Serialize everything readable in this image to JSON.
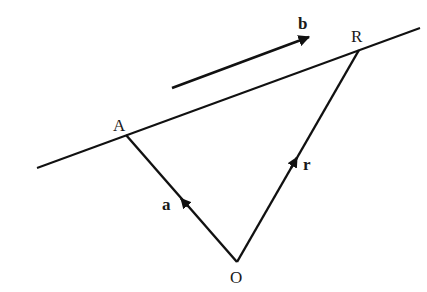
{
  "diagram": {
    "type": "vector-line-diagram",
    "colors": {
      "stroke": "#111111",
      "background": "#ffffff"
    },
    "points": {
      "A": {
        "label": "A",
        "x": 126,
        "y": 135
      },
      "R": {
        "label": "R",
        "x": 359,
        "y": 50
      },
      "O": {
        "label": "O",
        "x": 237,
        "y": 262
      }
    },
    "line": {
      "label": "line through A and R",
      "x1": 37,
      "y1": 168,
      "x2": 420,
      "y2": 28
    },
    "vectors": {
      "a": {
        "label": "a",
        "from": "O",
        "to": "A"
      },
      "r": {
        "label": "r",
        "from": "O",
        "to": "R"
      },
      "b": {
        "label": "b",
        "x1": 172,
        "y1": 88,
        "x2": 309,
        "y2": 37,
        "description": "direction vector parallel to line"
      }
    }
  }
}
